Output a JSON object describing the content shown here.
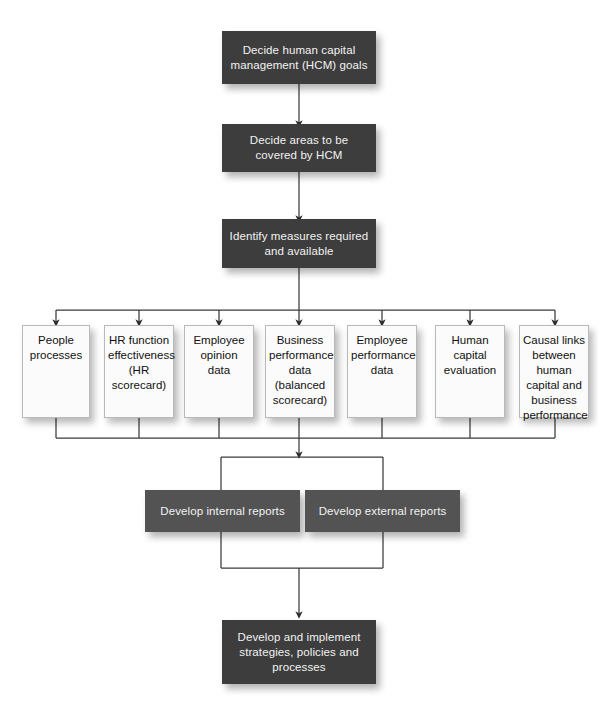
{
  "diagram": {
    "colors": {
      "dark_box": "#3d3d3d",
      "report_box": "#535353",
      "light_box": "#fbfbfb",
      "light_box_border": "#b9b9b9",
      "connector": "#3a3a3a",
      "background": "#ffffff",
      "dark_text": "#f2f2f2",
      "light_text": "#111111"
    }
  },
  "top_flow": [
    {
      "id": "decide-goals",
      "text": "Decide human capital management (HCM) goals"
    },
    {
      "id": "decide-areas",
      "text": "Decide areas to be covered by HCM"
    },
    {
      "id": "identify-measures",
      "text": "Identify measures required and available"
    }
  ],
  "measures": [
    {
      "id": "people-processes",
      "text": "People processes"
    },
    {
      "id": "hr-function-effectiveness",
      "text": "HR function effectiveness (HR scorecard)"
    },
    {
      "id": "employee-opinion-data",
      "text": "Employee opinion data"
    },
    {
      "id": "business-performance-data",
      "text": "Business performance data (balanced scorecard)"
    },
    {
      "id": "employee-performance-data",
      "text": "Employee performance data"
    },
    {
      "id": "human-capital-evaluation",
      "text": "Human capital evaluation"
    },
    {
      "id": "causal-links",
      "text": "Causal links between human capital and business performance"
    }
  ],
  "reports": [
    {
      "id": "internal-reports",
      "text": "Develop internal reports"
    },
    {
      "id": "external-reports",
      "text": "Develop external reports"
    }
  ],
  "outcome": {
    "id": "develop-implement",
    "text": "Develop and implement strategies, policies and processes"
  }
}
